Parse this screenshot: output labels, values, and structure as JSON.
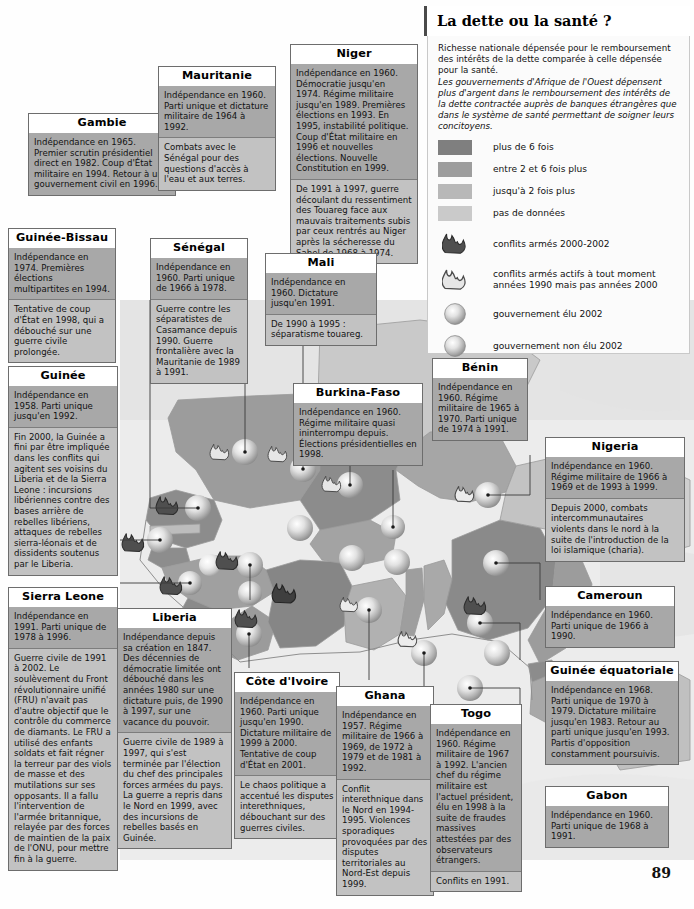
{
  "page": {
    "number": "89"
  },
  "legend": {
    "title": "La dette ou la santé ?",
    "intro_plain": "Richesse nationale dépensée pour le remboursement des intérêts de la dette comparée à celle dépensée pour la santé.",
    "intro_italic": "Les gouvernements d'Afrique de l'Ouest dépensent plus d'argent dans le remboursement des intérêts de la dette contractée auprès de banques étrangères que dans le système de santé permettant de soigner leurs concitoyens.",
    "swatches": [
      {
        "label": "plus de 6 fois",
        "color": "#7f7f7f"
      },
      {
        "label": "entre 2 et 6 fois plus",
        "color": "#9d9d9d"
      },
      {
        "label": "jusqu'à 2 fois plus",
        "color": "#b8b8b8"
      },
      {
        "label": "pas de données",
        "color": "#cacaca"
      }
    ],
    "symbols": [
      {
        "icon": "flame-dark-icon",
        "label": "conflits armés 2000-2002"
      },
      {
        "icon": "flame-light-icon",
        "label": "conflits armés actifs à tout moment années 1990 mais pas années 2000"
      },
      {
        "icon": "sphere-elected-icon",
        "label": "gouvernement élu 2002"
      },
      {
        "icon": "sphere-unelected-icon",
        "label": "gouvernement non élu 2002"
      }
    ]
  },
  "countries": [
    {
      "name": "Gambie",
      "sections": [
        "Indépendance en 1965. Premier scrutin présidentiel direct en 1982. Coup d'État militaire en 1994. Retour à un gouvernement civil en 1996."
      ]
    },
    {
      "name": "Mauritanie",
      "sections": [
        "Indépendance en 1960. Parti unique et dictature militaire de 1964 à 1992.",
        "Combats avec le Sénégal pour des questions d'accès à l'eau et aux terres."
      ]
    },
    {
      "name": "Niger",
      "sections": [
        "Indépendance en 1960. Démocratie jusqu'en 1974. Régime militaire jusqu'en 1989. Premières élections en 1993. En 1995, instabilité politique. Coup d'État militaire en 1996 et nouvelles élections. Nouvelle Constitution en 1999.",
        "De 1991 à 1997, guerre découlant du ressentiment des Touareg face aux mauvais traitements subis par ceux rentrés au Niger après la sécheresse du Sahel de 1968 à 1974."
      ]
    },
    {
      "name": "Guinée-Bissau",
      "sections": [
        "Indépendance en 1974. Premières élections multipartites en 1994.",
        "Tentative de coup d'État en 1998, qui a débouché sur une guerre civile prolongée."
      ]
    },
    {
      "name": "Sénégal",
      "sections": [
        "Indépendance en 1960. Parti unique de 1966 à 1978.",
        "Guerre contre les séparatistes de Casamance depuis 1990. Guerre frontalière avec la Mauritanie de 1989 à 1991."
      ]
    },
    {
      "name": "Mali",
      "sections": [
        "Indépendance en 1960. Dictature jusqu'en 1991.",
        "De 1990 à 1995 : séparatisme touareg."
      ]
    },
    {
      "name": "Guinée",
      "sections": [
        "Indépendance en 1958. Parti unique jusqu'en 1992.",
        "Fin 2000, la Guinée a fini par être impliquée dans les conflits qui agitent ses voisins du Liberia et de la Sierra Leone : incursions libériennes contre des bases arrière de rebelles libériens, attaques de rebelles sierra-léonais et de dissidents soutenus par le Liberia."
      ]
    },
    {
      "name": "Burkina-Faso",
      "sections": [
        "Indépendance en 1960. Régime militaire quasi ininterrompu depuis. Élections présidentielles en 1998."
      ]
    },
    {
      "name": "Bénin",
      "sections": [
        "Indépendance en 1960. Régime militaire de 1965 à 1970. Parti unique de 1974 à 1991."
      ]
    },
    {
      "name": "Nigeria",
      "sections": [
        "Indépendance en 1960. Régime militaire de 1966 à 1969 et de 1993 à 1999.",
        "Depuis 2000, combats intercommunautaires violents dans le nord à la suite de l'introduction de la loi islamique (charia)."
      ]
    },
    {
      "name": "Sierra Leone",
      "sections": [
        "Indépendance en 1991. Parti unique de 1978 à 1996.",
        "Guerre civile de 1991 à 2002. Le soulèvement du Front révolutionnaire unifié (FRU) n'avait pas d'autre objectif que le contrôle du commerce de diamants. Le FRU a utilisé des enfants soldats et fait régner la terreur par des viols de masse et des mutilations sur ses opposants. Il a fallu l'intervention de l'armée britannique, relayée par des forces de maintien de la paix de l'ONU, pour mettre fin à la guerre."
      ]
    },
    {
      "name": "Liberia",
      "sections": [
        "Indépendance depuis sa création en 1847. Des décennies de démocratie limitée ont débouché dans les années 1980 sur une dictature puis, de 1990 à 1997, sur une vacance du pouvoir.",
        "Guerre civile de 1989 à 1997, qui s'est terminée par l'élection du chef des principales forces armées du pays. La guerre a repris dans le Nord en 1999, avec des incursions de rebelles basés en Guinée."
      ]
    },
    {
      "name": "Côte d'Ivoire",
      "sections": [
        "Indépendance en 1960. Parti unique jusqu'en 1990. Dictature militaire de 1999 à 2000. Tentative de coup d'État en 2001.",
        "Le chaos politique a accentué les disputes interethniques, débouchant sur des guerres civiles."
      ]
    },
    {
      "name": "Ghana",
      "sections": [
        "Indépendance en 1957. Régime militaire de 1966 à 1969, de 1972 à 1979 et de 1981 à 1992.",
        "Conflit interethnique dans le Nord en 1994-1995. Violences sporadiques provoquées par des disputes territoriales au Nord-Est depuis 1999."
      ]
    },
    {
      "name": "Togo",
      "sections": [
        "Indépendance en 1960. Régime militaire de 1967 à 1992. L'ancien chef du régime militaire est l'actuel président, élu en 1998 à la suite de fraudes massives attestées par des observateurs étrangers.",
        "Conflits en 1991."
      ]
    },
    {
      "name": "Cameroun",
      "sections": [
        "Indépendance en 1960. Parti unique de 1966 à 1990."
      ]
    },
    {
      "name": "Guinée équatoriale",
      "sections": [
        "Indépendance en 1968. Parti unique de 1970 à 1979. Dictature militaire jusqu'en 1983. Retour au parti unique jusqu'en 1993. Partis d'opposition constamment poursuivis."
      ]
    },
    {
      "name": "Gabon",
      "sections": [
        "Indépendance en 1960. Parti unique de 1968 à 1991."
      ]
    }
  ]
}
